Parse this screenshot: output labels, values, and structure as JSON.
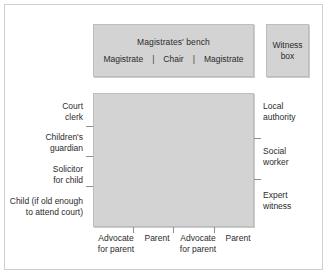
{
  "diagram": {
    "colors": {
      "furniture_fill": "#d3d3d3",
      "furniture_border": "#bdbdbd",
      "frame_border": "#cfcfcf",
      "text": "#2b2b2b",
      "tick": "#8d8d8d",
      "background": "#ffffff"
    }
  },
  "bench": {
    "title": "Magistrates' bench",
    "seats": [
      {
        "label": "Magistrate"
      },
      {
        "label": "Chair"
      },
      {
        "label": "Magistrate"
      }
    ],
    "separator": "|"
  },
  "witness_box": {
    "label": "Witness\nbox"
  },
  "table": {
    "left_seats": [
      {
        "label": "Court\nclerk"
      },
      {
        "label": "Children's\nguardian"
      },
      {
        "label": "Solicitor\nfor child"
      },
      {
        "label": "Child (if old enough\nto attend court)"
      }
    ],
    "right_seats": [
      {
        "label": "Local\nauthority"
      },
      {
        "label": "Social\nworker"
      },
      {
        "label": "Expert\nwitness"
      }
    ],
    "bottom_seats": [
      {
        "label": "Advocate\nfor parent"
      },
      {
        "label": "Parent"
      },
      {
        "label": "Advocate\nfor parent"
      },
      {
        "label": "Parent"
      }
    ]
  }
}
